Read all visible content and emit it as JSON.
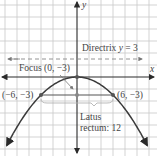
{
  "diagram": {
    "equation": "x^2 = -12y",
    "axes": {
      "x_label": "x",
      "y_label": "y"
    },
    "vertex": {
      "x": 0,
      "y": 0
    },
    "focus": {
      "x": 0,
      "y": -3,
      "label": "Focus (0, −3)"
    },
    "directrix": {
      "y": 3,
      "label_prefix": "Directrix ",
      "label_var": "y",
      "label_suffix": " = 3"
    },
    "latus_rectum": {
      "left_point": {
        "x": -6,
        "y": -3,
        "label": "(−6, −3)"
      },
      "right_point": {
        "x": 6,
        "y": -3,
        "label": "(6, −3)"
      },
      "label_line1": "Latus",
      "label_line2": "rectum: 12",
      "length": 12
    },
    "grid_step": 2,
    "colors": {
      "curve": "#3a3a3a",
      "grid": "#c8c8c8",
      "axis": "#2a2a2a",
      "text": "#444444",
      "highlight_point": "#6a6a6a"
    }
  }
}
